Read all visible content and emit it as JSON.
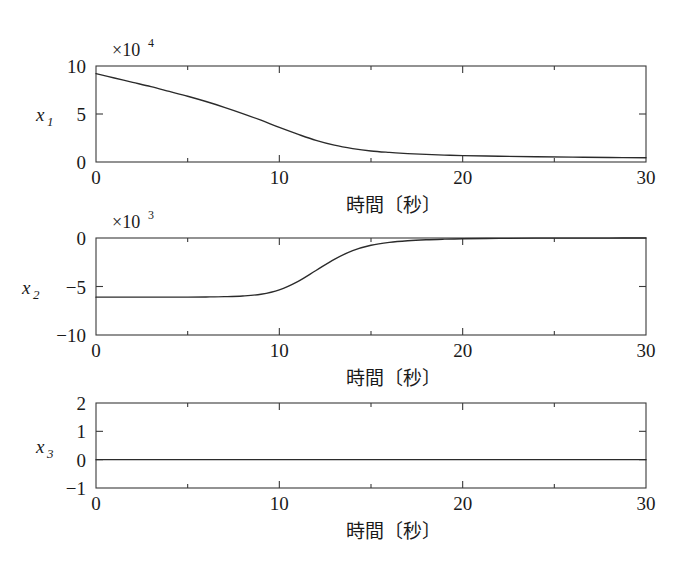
{
  "figure": {
    "background_color": "#ffffff",
    "line_color": "#2b2b2b",
    "axis_color": "#3a3a3a"
  },
  "chart_data": [
    {
      "type": "line",
      "title": "",
      "xlabel": "時間〔秒〕",
      "ylabel": "x1",
      "ylabel_base": "x",
      "ylabel_sub": "1",
      "y_multiplier": "×10",
      "y_multiplier_exp": "4",
      "xlim": [
        0,
        30
      ],
      "ylim": [
        0,
        10
      ],
      "xticks": [
        0,
        10,
        20,
        30
      ],
      "xticklabels": [
        "0",
        "10",
        "20",
        "30"
      ],
      "xminorticks": [
        5,
        15,
        25
      ],
      "yticks": [
        0,
        5,
        10
      ],
      "yticklabels": [
        "0",
        "5",
        "10"
      ],
      "grid": false,
      "legend": false,
      "x": [
        0,
        1,
        2,
        3,
        4,
        5,
        6,
        7,
        8,
        9,
        10,
        11,
        12,
        13,
        14,
        15,
        16,
        17,
        18,
        19,
        20,
        22,
        24,
        26,
        28,
        30
      ],
      "y": [
        9.2,
        8.75,
        8.3,
        7.85,
        7.35,
        6.85,
        6.3,
        5.7,
        5.05,
        4.35,
        3.6,
        2.9,
        2.25,
        1.75,
        1.4,
        1.15,
        1.0,
        0.88,
        0.79,
        0.72,
        0.67,
        0.6,
        0.55,
        0.51,
        0.47,
        0.44
      ]
    },
    {
      "type": "line",
      "title": "",
      "xlabel": "時間〔秒〕",
      "ylabel": "x2",
      "ylabel_base": "x",
      "ylabel_sub": "2",
      "y_multiplier": "×10",
      "y_multiplier_exp": "3",
      "xlim": [
        0,
        30
      ],
      "ylim": [
        -10,
        0
      ],
      "xticks": [
        0,
        10,
        20,
        30
      ],
      "xticklabels": [
        "0",
        "10",
        "20",
        "30"
      ],
      "xminorticks": [
        5,
        15,
        25
      ],
      "yticks": [
        -10,
        -5,
        0
      ],
      "yticklabels": [
        "−10",
        "−5",
        "0"
      ],
      "grid": false,
      "legend": false,
      "x": [
        0,
        1,
        2,
        3,
        4,
        5,
        6,
        7,
        8,
        9,
        10,
        11,
        12,
        13,
        14,
        15,
        16,
        17,
        18,
        19,
        20,
        22,
        24,
        26,
        28,
        30
      ],
      "y": [
        -6.1,
        -6.1,
        -6.1,
        -6.1,
        -6.1,
        -6.1,
        -6.08,
        -6.05,
        -5.98,
        -5.8,
        -5.35,
        -4.5,
        -3.35,
        -2.2,
        -1.3,
        -0.75,
        -0.45,
        -0.28,
        -0.18,
        -0.12,
        -0.08,
        -0.04,
        -0.02,
        -0.01,
        -0.005,
        0.0
      ]
    },
    {
      "type": "line",
      "title": "",
      "xlabel": "時間〔秒〕",
      "ylabel": "x3",
      "ylabel_base": "x",
      "ylabel_sub": "3",
      "y_multiplier": "",
      "y_multiplier_exp": "",
      "xlim": [
        0,
        30
      ],
      "ylim": [
        -1,
        2
      ],
      "xticks": [
        0,
        10,
        20,
        30
      ],
      "xticklabels": [
        "0",
        "10",
        "20",
        "30"
      ],
      "xminorticks": [
        5,
        15,
        25
      ],
      "yticks": [
        -1,
        0,
        1,
        2
      ],
      "yticklabels": [
        "−1",
        "0",
        "1",
        "2"
      ],
      "grid": false,
      "legend": false,
      "x": [
        0,
        30
      ],
      "y": [
        0,
        0
      ]
    }
  ]
}
